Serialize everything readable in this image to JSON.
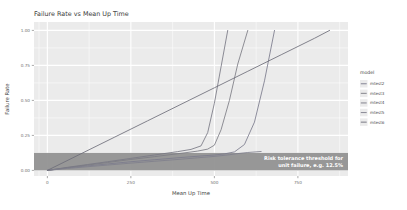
{
  "chart_data": {
    "type": "line",
    "title": "Failure Rate vs Mean Up Time",
    "xlabel": "Mean Up Time",
    "ylabel": "Failure Rate",
    "xlim": [
      -40,
      900
    ],
    "ylim": [
      -0.04,
      1.06
    ],
    "xticks": [
      0,
      250,
      500,
      750
    ],
    "xtick_labels": [
      "0",
      "250",
      "500",
      "750"
    ],
    "yticks": [
      0.0,
      0.25,
      0.5,
      0.75,
      1.0
    ],
    "ytick_labels": [
      "0.00",
      "0.25",
      "0.50",
      "0.75",
      "1.00"
    ],
    "grid": true,
    "legend_position": "right",
    "legend_title": "model",
    "series": [
      {
        "name": "mtest2",
        "color": "#7b7b8c",
        "x": [
          0,
          60,
          120,
          180,
          250,
          320,
          400,
          460,
          500,
          530,
          560,
          590,
          620,
          650,
          680
        ],
        "y": [
          0.0,
          0.018,
          0.032,
          0.046,
          0.062,
          0.076,
          0.092,
          0.103,
          0.11,
          0.118,
          0.132,
          0.185,
          0.345,
          0.64,
          1.0
        ]
      },
      {
        "name": "mtest3",
        "color": "#7c7c84",
        "x": [
          0,
          60,
          120,
          180,
          250,
          320,
          400,
          450,
          480,
          500,
          520,
          545,
          570,
          600
        ],
        "y": [
          0.0,
          0.02,
          0.038,
          0.056,
          0.078,
          0.098,
          0.122,
          0.138,
          0.152,
          0.18,
          0.29,
          0.5,
          0.76,
          1.0
        ]
      },
      {
        "name": "mtest4",
        "color": "#787884",
        "x": [
          0,
          60,
          120,
          180,
          250,
          320,
          390,
          430,
          460,
          480,
          500,
          520,
          540
        ],
        "y": [
          0.0,
          0.022,
          0.042,
          0.062,
          0.086,
          0.11,
          0.134,
          0.15,
          0.175,
          0.27,
          0.48,
          0.74,
          1.0
        ]
      },
      {
        "name": "mtest5",
        "color": "#80808c",
        "x": [
          0,
          60,
          120,
          180,
          250,
          320,
          400,
          450,
          490,
          520,
          545,
          570,
          600,
          640
        ],
        "y": [
          0.0,
          0.014,
          0.026,
          0.038,
          0.052,
          0.065,
          0.08,
          0.09,
          0.098,
          0.105,
          0.112,
          0.12,
          0.128,
          0.135
        ]
      },
      {
        "name": "mtest6",
        "color": "#6e6e7a",
        "x": [
          0,
          100,
          200,
          300,
          400,
          500,
          600,
          700,
          800,
          845
        ],
        "y": [
          0.0,
          0.118,
          0.236,
          0.354,
          0.472,
          0.59,
          0.708,
          0.826,
          0.944,
          1.0
        ]
      }
    ],
    "band": {
      "y_min": 0.0,
      "y_max": 0.125,
      "color": "#8f8f8f",
      "annotation_line1": "Risk tolerance threshold for",
      "annotation_line2": "unit failure, e.g. 12.5%"
    }
  }
}
